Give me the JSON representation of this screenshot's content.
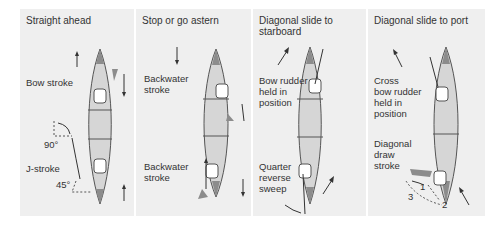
{
  "colors": {
    "page_bg": "#ffffff",
    "panel_bg": "#efefef",
    "canoe_fill": "#d6d6d6",
    "canoe_tip": "#8c8c8c",
    "outline": "#555555",
    "text": "#333333"
  },
  "panels": [
    {
      "title": "Straight ahead",
      "labels": {
        "bow": "Bow stroke",
        "angle_90": "90°",
        "stern": "J-stroke",
        "angle_45": "45°"
      },
      "arrows": [
        "up",
        "down",
        "up"
      ]
    },
    {
      "title": "Stop or go astern",
      "labels": {
        "bow": "Backwater\nstroke",
        "stern": "Backwater\nstroke"
      },
      "arrows": [
        "down",
        "down",
        "up",
        "down"
      ]
    },
    {
      "title": "Diagonal slide to\nstarboard",
      "labels": {
        "bow": "Bow rudder\nheld in\nposition",
        "stern": "Quarter\nreverse\nsweep"
      },
      "arrows": [
        "up-right",
        "up-right"
      ]
    },
    {
      "title": "Diagonal slide to\nport",
      "labels": {
        "bow": "Cross\nbow rudder\nheld in\nposition",
        "stern": "Diagonal\ndraw\nstroke",
        "step_1": "1",
        "step_2": "2",
        "step_3": "3"
      },
      "arrows": [
        "up-left",
        "up-left"
      ]
    }
  ]
}
